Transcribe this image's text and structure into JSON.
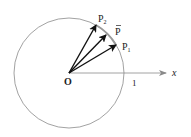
{
  "diagram": {
    "type": "unit-circle-vectors",
    "origin_label": "O",
    "axis_label": "x",
    "unit_label": "1",
    "points": [
      {
        "id": "P2",
        "label": "P",
        "subscript": "2"
      },
      {
        "id": "Pbar",
        "label": "P",
        "overbar": true
      },
      {
        "id": "P1",
        "label": "P",
        "subscript": "1"
      }
    ],
    "colors": {
      "circle": "#8a8a8a",
      "axis": "#8a8a8a",
      "vectors": "#111111",
      "arc_highlight": "#9a9a9a",
      "text": "#222222"
    }
  }
}
